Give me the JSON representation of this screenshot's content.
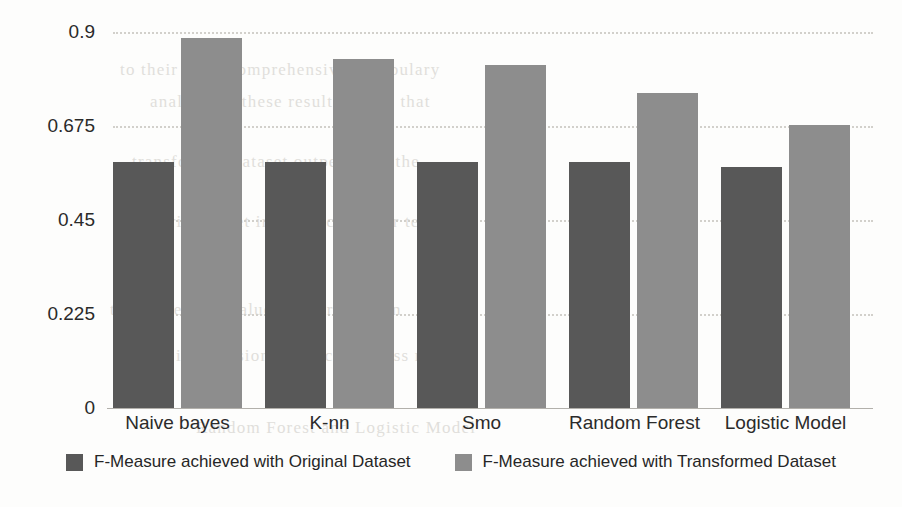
{
  "chart_data": {
    "type": "bar",
    "title": "",
    "subtitle": "",
    "xlabel": "",
    "ylabel": "",
    "categories": [
      "Naive bayes",
      "K-nn",
      "Smo",
      "Random Forest",
      "Logistic Model"
    ],
    "series": [
      {
        "name": "F-Measure achieved with Original Dataset",
        "color": "#585858",
        "values": [
          0.59,
          0.59,
          0.59,
          0.59,
          0.577
        ]
      },
      {
        "name": "F-Measure achieved with Transformed Dataset",
        "color": "#8d8d8d",
        "values": [
          0.885,
          0.835,
          0.82,
          0.753,
          0.678
        ]
      }
    ],
    "ylim": [
      0,
      0.9
    ],
    "yticks": [
      0,
      0.225,
      0.45,
      0.675,
      0.9
    ],
    "ytick_labels": [
      "0",
      "0.225",
      "0.45",
      "0.675",
      "0.9"
    ],
    "grid": true,
    "grid_axis": "y",
    "grid_style": "dotted",
    "grid_color": "#d2d0cb",
    "legend": true,
    "legend_position": "bottom",
    "background_color": "#fdfdfc",
    "axis_color": "#b2b0ab",
    "text_color": "#2a2a2a"
  },
  "legend": {
    "items": [
      {
        "label": "F-Measure achieved with Original Dataset",
        "swatch": "legend-swatch-original"
      },
      {
        "label": "F-Measure achieved with Transformed Dataset",
        "swatch": "legend-swatch-transformed"
      }
    ]
  },
  "page_background": {
    "ghost_lines": [
      "to their more comprehensive vocabulary",
      "analysis of these results shows that",
      "transformed dataset outperforms the",
      "original set in every classifier tested",
      "the F-Measure values confirm a gain",
      "in precision and recall across models",
      "Random Forest and Logistic Model"
    ]
  }
}
